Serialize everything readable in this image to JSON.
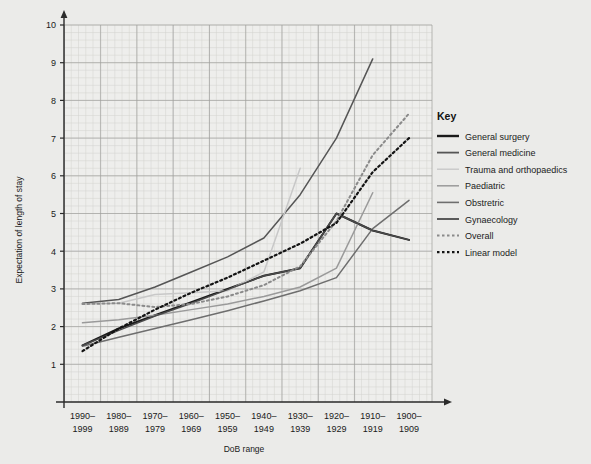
{
  "chart_data": {
    "type": "line",
    "title": "",
    "xlabel": "DoB range",
    "ylabel": "Expectation of length of stay",
    "categories": [
      "1990–\n1999",
      "1980–\n1989",
      "1970–\n1979",
      "1960–\n1969",
      "1950–\n1959",
      "1940–\n1949",
      "1930–\n1939",
      "1920–\n1929",
      "1910–\n1919",
      "1900–\n1909"
    ],
    "categories_line1": [
      "1990–",
      "1980–",
      "1970–",
      "1960–",
      "1950–",
      "1940–",
      "1930–",
      "1920–",
      "1910–",
      "1900–"
    ],
    "categories_line2": [
      "1999",
      "1989",
      "1979",
      "1969",
      "1959",
      "1949",
      "1939",
      "1929",
      "1919",
      "1909"
    ],
    "ylim": [
      0,
      10
    ],
    "yticks": [
      1,
      2,
      3,
      4,
      5,
      6,
      7,
      8,
      9,
      10
    ],
    "grid": "graph-paper-minor-and-major",
    "legend_position": "right",
    "legend_title": "Key",
    "series": [
      {
        "name": "General surgery",
        "color": "#1a1a1a",
        "width": 2.0,
        "dash": "none",
        "values": [
          1.5,
          1.95,
          2.3,
          2.65,
          3.0,
          3.35,
          3.55,
          5.0,
          4.55,
          4.3
        ]
      },
      {
        "name": "General medicine",
        "color": "#555555",
        "width": 1.5,
        "dash": "none",
        "values": [
          2.62,
          2.72,
          3.05,
          3.45,
          3.85,
          4.35,
          5.5,
          7.0,
          9.1,
          null
        ]
      },
      {
        "name": "Trauma and orthopaedics",
        "color": "#c8c8c8",
        "width": 1.5,
        "dash": "none",
        "values": [
          2.6,
          2.62,
          2.85,
          2.9,
          2.95,
          3.45,
          6.2,
          null,
          null,
          null
        ]
      },
      {
        "name": "Paediatric",
        "color": "#9a9a9a",
        "width": 1.5,
        "dash": "none",
        "values": [
          2.1,
          2.18,
          2.3,
          2.45,
          2.6,
          2.8,
          3.05,
          3.55,
          5.55,
          null
        ]
      },
      {
        "name": "Obstretric",
        "color": "#6e6e6e",
        "width": 1.5,
        "dash": "none",
        "values": [
          1.48,
          1.72,
          1.95,
          2.18,
          2.42,
          2.68,
          2.95,
          3.3,
          4.6,
          5.35
        ]
      },
      {
        "name": "Gynaecology",
        "color": "#4a4a4a",
        "width": 1.5,
        "dash": "none",
        "values": [
          1.5,
          1.9,
          2.28,
          2.62,
          2.98,
          3.35,
          3.55,
          5.0,
          4.55,
          4.3
        ]
      },
      {
        "name": "Overall",
        "color": "#8a8a8a",
        "width": 2.0,
        "dash": "2,3",
        "values": [
          2.6,
          2.62,
          2.52,
          2.6,
          2.8,
          3.1,
          3.6,
          4.8,
          6.55,
          7.65
        ]
      },
      {
        "name": "Linear model",
        "color": "#141414",
        "width": 2.2,
        "dash": "2,3",
        "values": [
          1.35,
          1.95,
          2.45,
          2.9,
          3.3,
          3.75,
          4.2,
          4.75,
          6.1,
          7.0
        ]
      }
    ]
  },
  "legend": {
    "title": "Key",
    "items": [
      {
        "label": "General surgery",
        "color": "#1a1a1a",
        "width": 2.4,
        "dash": "none"
      },
      {
        "label": "General medicine",
        "color": "#555555",
        "width": 1.8,
        "dash": "none"
      },
      {
        "label": "Trauma and orthopaedics",
        "color": "#c8c8c8",
        "width": 1.4,
        "dash": "none"
      },
      {
        "label": "Paediatric",
        "color": "#9a9a9a",
        "width": 1.5,
        "dash": "none"
      },
      {
        "label": "Obstretric",
        "color": "#6e6e6e",
        "width": 1.6,
        "dash": "none"
      },
      {
        "label": "Gynaecology",
        "color": "#4a4a4a",
        "width": 1.8,
        "dash": "none"
      },
      {
        "label": "Overall",
        "color": "#8a8a8a",
        "width": 2.0,
        "dash": "2.5,2.5"
      },
      {
        "label": "Linear model",
        "color": "#141414",
        "width": 2.2,
        "dash": "2.5,2.5"
      }
    ]
  },
  "colors": {
    "background": "#ebebe9",
    "plot_background": "#eeeeec",
    "grid_minor": "#d2d2cf",
    "grid_major": "#9f9f9c",
    "axis": "#2b2b2b",
    "text": "#1a1a1a"
  }
}
